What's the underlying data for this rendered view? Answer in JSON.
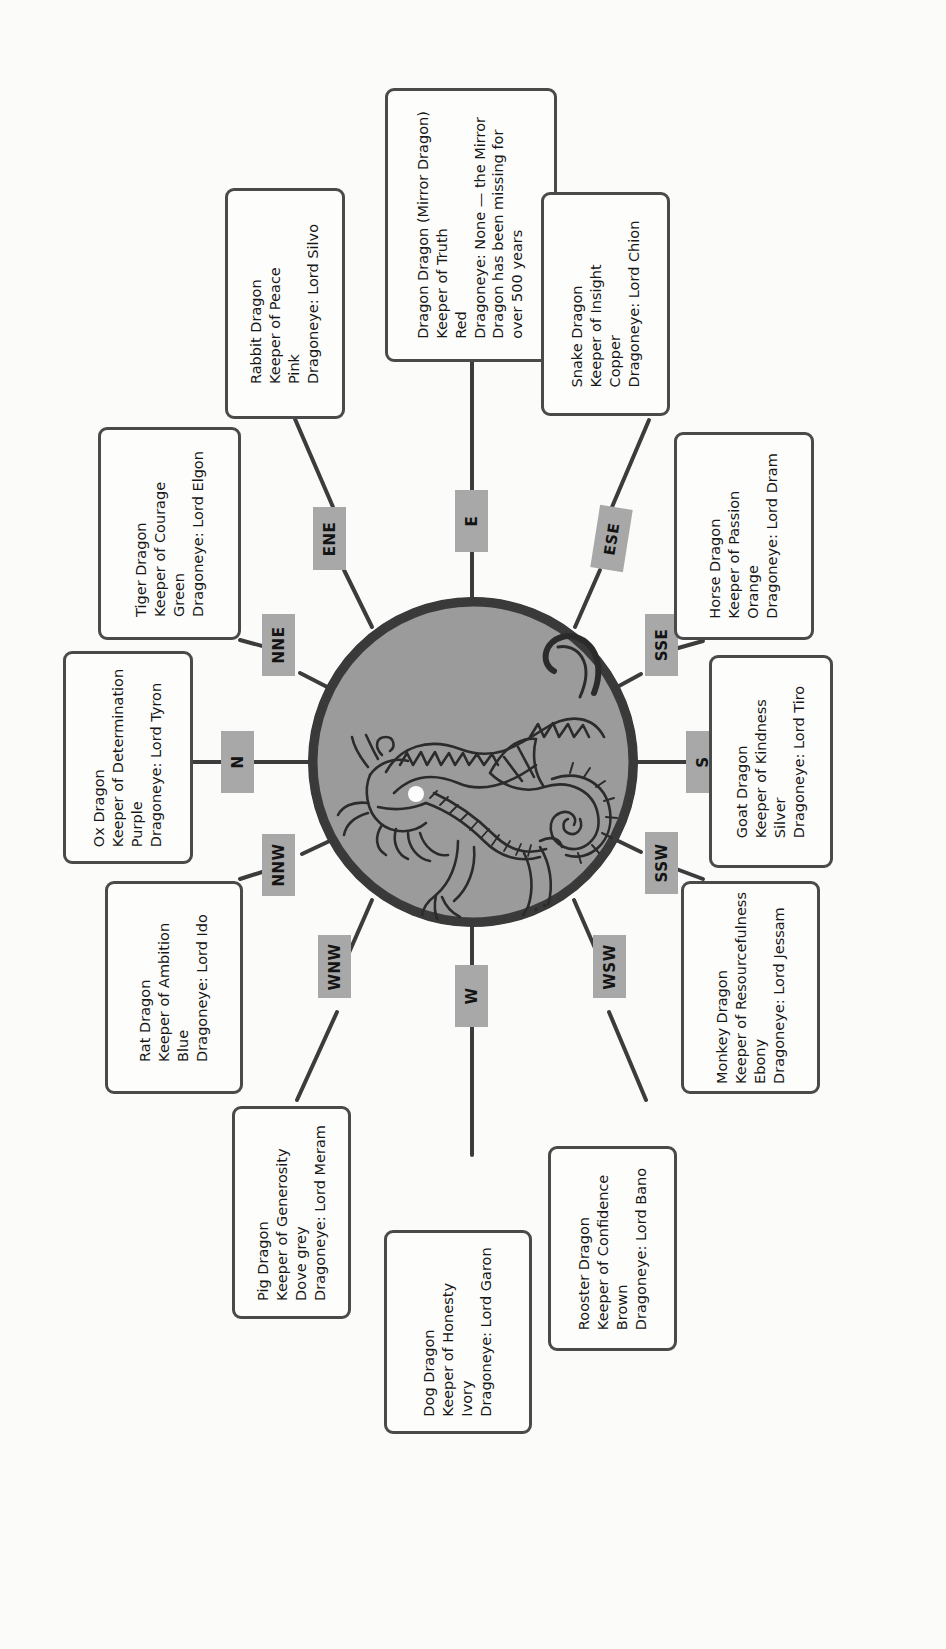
{
  "page": {
    "orientation": "text rotated 90 degrees counter-clockwise",
    "background_color": "#fbfbfa",
    "medallion": {
      "name": "dragon-medallion",
      "fill_color": "#9b9b9b",
      "border_color": "#3a3a3a",
      "description": "circular grey medallion containing a line-art dragon with a white pearl"
    }
  },
  "compass_tags": [
    {
      "id": "e",
      "label": "E",
      "name": "compass-tag-e"
    },
    {
      "id": "ene",
      "label": "ENE",
      "name": "compass-tag-ene"
    },
    {
      "id": "nne",
      "label": "NNE",
      "name": "compass-tag-nne"
    },
    {
      "id": "n",
      "label": "N",
      "name": "compass-tag-n"
    },
    {
      "id": "nnw",
      "label": "NNW",
      "name": "compass-tag-nnw"
    },
    {
      "id": "wnw",
      "label": "WNW",
      "name": "compass-tag-wnw"
    },
    {
      "id": "w",
      "label": "W",
      "name": "compass-tag-w"
    },
    {
      "id": "wsw",
      "label": "WSW",
      "name": "compass-tag-wsw"
    },
    {
      "id": "ssw",
      "label": "SSW",
      "name": "compass-tag-ssw"
    },
    {
      "id": "s",
      "label": "S",
      "name": "compass-tag-s"
    },
    {
      "id": "sse",
      "label": "SSE",
      "name": "compass-tag-sse"
    },
    {
      "id": "ese",
      "label": "ESE",
      "name": "compass-tag-ese"
    }
  ],
  "dragons": {
    "dragon": {
      "name": "Dragon Dragon (Mirror Dragon)",
      "keeper": "Keeper of Truth",
      "colour": "Red",
      "dragoneye": "Dragoneye: None — the Mirror",
      "note_line2": "Dragon has been missing for",
      "note_line3": "over 500 years",
      "text": "Dragon Dragon (Mirror Dragon)\nKeeper of Truth\nRed\nDragoneye: None — the Mirror\nDragon has been missing for\nover 500 years"
    },
    "rabbit": {
      "name": "Rabbit Dragon",
      "keeper": "Keeper of Peace",
      "colour": "Pink",
      "dragoneye": "Dragoneye: Lord Silvo",
      "text": "Rabbit Dragon\nKeeper of Peace\nPink\nDragoneye: Lord Silvo"
    },
    "tiger": {
      "name": "Tiger Dragon",
      "keeper": "Keeper of Courage",
      "colour": "Green",
      "dragoneye": "Dragoneye: Lord Elgon",
      "text": "Tiger Dragon\nKeeper of Courage\nGreen\nDragoneye: Lord Elgon"
    },
    "ox": {
      "name": "Ox Dragon",
      "keeper": "Keeper of Determination",
      "colour": "Purple",
      "dragoneye": "Dragoneye: Lord Tyron",
      "text": "Ox Dragon\nKeeper of Determination\nPurple\nDragoneye: Lord Tyron"
    },
    "rat": {
      "name": "Rat Dragon",
      "keeper": "Keeper of Ambition",
      "colour": "Blue",
      "dragoneye": "Dragoneye: Lord Ido",
      "text": "Rat Dragon\nKeeper of Ambition\nBlue\nDragoneye: Lord Ido"
    },
    "pig": {
      "name": "Pig Dragon",
      "keeper": "Keeper of Generosity",
      "colour": "Dove grey",
      "dragoneye": "Dragoneye: Lord Meram",
      "text": "Pig Dragon\nKeeper of Generosity\nDove grey\nDragoneye: Lord Meram"
    },
    "dog": {
      "name": "Dog Dragon",
      "keeper": "Keeper of Honesty",
      "colour": "Ivory",
      "dragoneye": "Dragoneye: Lord Garon",
      "text": "Dog Dragon\nKeeper of Honesty\nIvory\nDragoneye: Lord Garon"
    },
    "rooster": {
      "name": "Rooster Dragon",
      "keeper": "Keeper of Confidence",
      "colour": "Brown",
      "dragoneye": "Dragoneye: Lord Bano",
      "text": "Rooster Dragon\nKeeper of Confidence\nBrown\nDragoneye: Lord Bano"
    },
    "monkey": {
      "name": "Monkey Dragon",
      "keeper": "Keeper of Resourcefulness",
      "colour": "Ebony",
      "dragoneye": "Dragoneye: Lord Jessam",
      "text": "Monkey Dragon\nKeeper of Resourcefulness\nEbony\nDragoneye: Lord Jessam"
    },
    "goat": {
      "name": "Goat Dragon",
      "keeper": "Keeper of Kindness",
      "colour": "Silver",
      "dragoneye": "Dragoneye: Lord Tiro",
      "text": "Goat Dragon\nKeeper of Kindness\nSilver\nDragoneye: Lord Tiro"
    },
    "horse": {
      "name": "Horse Dragon",
      "keeper": "Keeper of Passion",
      "colour": "Orange",
      "dragoneye": "Dragoneye: Lord Dram",
      "text": "Horse Dragon\nKeeper of Passion\nOrange\nDragoneye: Lord Dram"
    },
    "snake": {
      "name": "Snake Dragon",
      "keeper": "Keeper of Insight",
      "colour": "Copper",
      "dragoneye": "Dragoneye: Lord Chion",
      "text": "Snake Dragon\nKeeper of Insight\nCopper\nDragoneye: Lord Chion"
    }
  }
}
